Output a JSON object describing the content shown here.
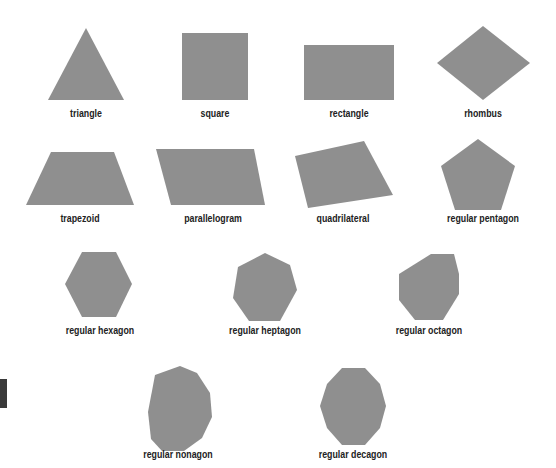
{
  "fill_color": "#8f8f8f",
  "shapes": [
    {
      "label": "triangle",
      "points": "48,100 86,28 124,100",
      "label_x": 86,
      "label_y": 108
    },
    {
      "label": "square",
      "points": "182,33 248,33 248,100 182,100",
      "label_x": 215,
      "label_y": 108
    },
    {
      "label": "rectangle",
      "points": "304,45 394,45 394,100 304,100",
      "label_x": 349,
      "label_y": 108
    },
    {
      "label": "rhombus",
      "points": "483,26 530,63 483,100 437,63",
      "label_x": 483,
      "label_y": 108
    },
    {
      "label": "trapezoid",
      "points": "51,152 114,152 134,205 26,205",
      "label_x": 80,
      "label_y": 213
    },
    {
      "label": "parallelogram",
      "points": "156,149 254,149 265,205 171,205",
      "label_x": 213,
      "label_y": 213
    },
    {
      "label": "quadrilateral",
      "points": "295,156 364,141 393,195 308,208",
      "label_x": 343,
      "label_y": 213
    },
    {
      "label": "regular pentagon",
      "points": "478,139 515,166 501,210 455,210 441,166",
      "label_x": 483,
      "label_y": 213
    },
    {
      "label": "regular hexagon",
      "points": "82,252 116,252 132,284 116,317 82,317 65,284",
      "label_x": 100,
      "label_y": 325
    },
    {
      "label": "regular heptagon",
      "points": "265,253 290,265 297,290 280,321 249,321 233,298 238,267",
      "label_x": 265,
      "label_y": 325
    },
    {
      "label": "regular octagon",
      "points": "431,254 454,254 459,274 459,294 443,320 415,320 399,300 399,274",
      "label_x": 429,
      "label_y": 325
    },
    {
      "label": "regular nonagon",
      "points": "180,366 197,373 210,393 212,417 202,438 184,451 162,451 151,439 148,412 155,375",
      "label_x": 178,
      "label_y": 449
    },
    {
      "label": "regular decagon",
      "points": "342,368 365,368 380,384 386,406 380,428 365,445 342,445 327,428 320,406 327,384",
      "label_x": 353,
      "label_y": 449
    }
  ]
}
